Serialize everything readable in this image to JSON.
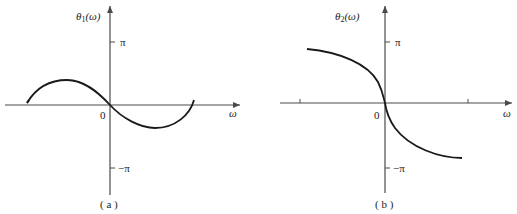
{
  "panels": [
    {
      "id": "a",
      "caption": "( a )",
      "y_axis_label_symbol": "θ",
      "y_axis_label_subscript": "1",
      "y_axis_label_arg": "(ω)",
      "x_axis_label": "ω",
      "origin_label": "0",
      "y_tick_top": "π",
      "y_tick_bottom": "−π",
      "curve_description": "sine-like phase: rises to a positive peak for ω<0, passes through origin, dips to a negative trough for ω>0, returns to zero at both ends"
    },
    {
      "id": "b",
      "caption": "( b )",
      "y_axis_label_symbol": "θ",
      "y_axis_label_subscript": "2",
      "y_axis_label_arg": "(ω)",
      "x_axis_label": "ω",
      "origin_label": "0",
      "y_tick_top": "π",
      "y_tick_bottom": "−π",
      "curve_description": "monotonically decreasing odd phase: approaches just below π for negative ω, steep drop through origin, approaches just above −π for positive ω"
    }
  ],
  "colors": {
    "axis": "#4a4a4a",
    "curve": "#1a1a1a",
    "background": "#ffffff"
  }
}
